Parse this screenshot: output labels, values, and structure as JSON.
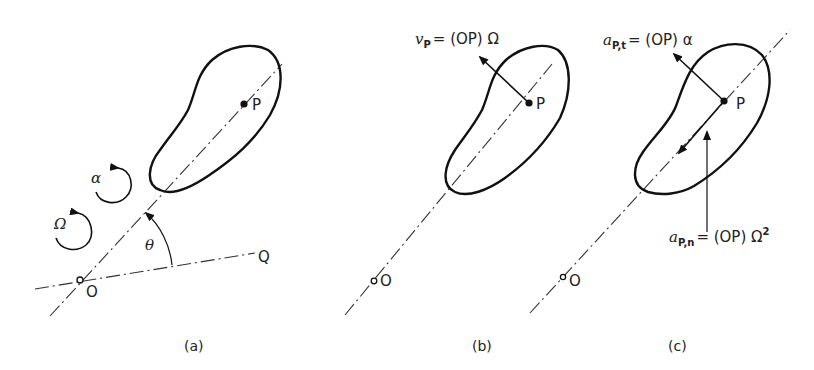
{
  "panels": {
    "a": {
      "caption": "(a)",
      "point_p": "P",
      "point_o": "O",
      "point_q": "Q",
      "angle": "θ",
      "angular_velocity": "Ω",
      "angular_acceleration": "α"
    },
    "b": {
      "caption": "(b)",
      "point_p": "P",
      "point_o": "O",
      "velocity_symbol": "v",
      "velocity_sub": "P",
      "velocity_expr": "= (OP) Ω"
    },
    "c": {
      "caption": "(c)",
      "point_p": "P",
      "point_o": "O",
      "tangential_symbol": "a",
      "tangential_sub": "P,t",
      "tangential_expr": "= (OP) α",
      "normal_symbol": "a",
      "normal_sub": "P,n",
      "normal_expr": "= (OP) Ω",
      "normal_exp": "2"
    }
  },
  "colors": {
    "ink": "#111111",
    "background": "#ffffff"
  }
}
